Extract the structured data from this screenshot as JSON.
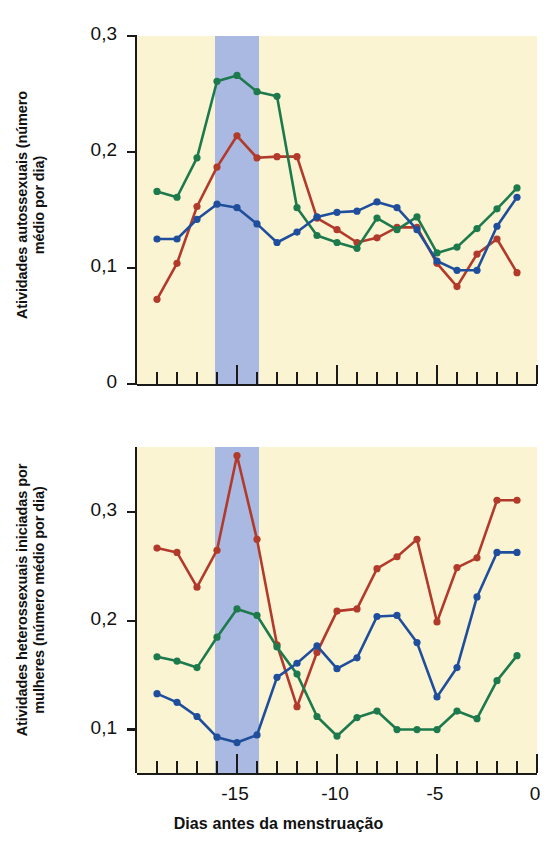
{
  "figure": {
    "background": "#ffffff",
    "plot_background": "#fbf4d3",
    "band_color": "#a9b9e2",
    "axis_color": "#1a1a1a"
  },
  "colors": {
    "red": "#b23a2b",
    "green": "#1d7a4c",
    "blue": "#1f4e9c"
  },
  "axis_titles": {
    "top_y": "Atividades autossexuais (número\nmédio por dia)",
    "bottom_y": "Atividades heterossexuais iniciadas por\nmulheres (número médio por dia)",
    "x": "Dias antes da menstruação"
  },
  "x_axis": {
    "labels": [
      "-15",
      "-10",
      "-5",
      "0"
    ],
    "label_values": [
      -15,
      -10,
      -5,
      0
    ],
    "min": -20,
    "max": 0,
    "major_ticks": [
      -15,
      -10,
      -5,
      0
    ],
    "minor_ticks": [
      -19,
      -18,
      -17,
      -16,
      -14,
      -13,
      -12,
      -11,
      -9,
      -8,
      -7,
      -6,
      -4,
      -3,
      -2,
      -1
    ]
  },
  "top_y_axis": {
    "labels": [
      "0",
      "0,1",
      "0,2",
      "0,3"
    ],
    "label_values": [
      0,
      0.1,
      0.2,
      0.3
    ],
    "min": 0,
    "max": 0.3
  },
  "bottom_y_axis": {
    "labels": [
      "0,1",
      "0,2",
      "0,3"
    ],
    "label_values": [
      0.1,
      0.2,
      0.3
    ],
    "min": 0.06,
    "max": 0.36
  },
  "highlight_band": {
    "start": -16.1,
    "end": -13.9,
    "label": "periovulatory-band"
  },
  "chart_data": [
    {
      "id": "chart-top",
      "type": "line",
      "title": "",
      "xlabel": "Dias antes da menstruação",
      "ylabel": "Atividades autossexuais (número médio por dia)",
      "xlim": [
        -20,
        0
      ],
      "ylim": [
        0,
        0.3
      ],
      "grid": false,
      "legend": "none",
      "x": [
        -19,
        -18,
        -17,
        -16,
        -15,
        -14,
        -13,
        -12,
        -11,
        -10,
        -9,
        -8,
        -7,
        -6,
        -5,
        -4,
        -3,
        -2,
        -1
      ],
      "series": [
        {
          "name": "red",
          "color": "#b23a2b",
          "values": [
            0.073,
            0.104,
            0.153,
            0.187,
            0.214,
            0.195,
            0.196,
            0.196,
            0.143,
            0.133,
            0.122,
            0.126,
            0.135,
            0.135,
            0.104,
            0.084,
            0.112,
            0.125,
            0.096
          ]
        },
        {
          "name": "green",
          "color": "#1d7a4c",
          "values": [
            0.166,
            0.161,
            0.195,
            0.261,
            0.266,
            0.252,
            0.248,
            0.152,
            0.128,
            0.122,
            0.117,
            0.143,
            0.133,
            0.144,
            0.113,
            0.118,
            0.134,
            0.151,
            0.169
          ]
        },
        {
          "name": "blue",
          "color": "#1f4e9c",
          "values": [
            0.125,
            0.125,
            0.142,
            0.155,
            0.152,
            0.138,
            0.122,
            0.131,
            0.144,
            0.148,
            0.149,
            0.157,
            0.152,
            0.133,
            0.106,
            0.098,
            0.098,
            0.136,
            0.161
          ]
        }
      ]
    },
    {
      "id": "chart-bottom",
      "type": "line",
      "title": "",
      "xlabel": "Dias antes da menstruação",
      "ylabel": "Atividades heterossexuais iniciadas por mulheres (número médio por dia)",
      "xlim": [
        -20,
        0
      ],
      "ylim": [
        0.06,
        0.36
      ],
      "grid": false,
      "legend": "none",
      "x": [
        -19,
        -18,
        -17,
        -16,
        -15,
        -14,
        -13,
        -12,
        -11,
        -10,
        -9,
        -8,
        -7,
        -6,
        -5,
        -4,
        -3,
        -2,
        -1
      ],
      "series": [
        {
          "name": "red",
          "color": "#b23a2b",
          "values": [
            0.267,
            0.263,
            0.231,
            0.265,
            0.352,
            0.275,
            0.178,
            0.121,
            0.171,
            0.209,
            0.211,
            0.248,
            0.259,
            0.275,
            0.199,
            0.249,
            0.258,
            0.311,
            0.311
          ]
        },
        {
          "name": "green",
          "color": "#1d7a4c",
          "values": [
            0.167,
            0.163,
            0.157,
            0.185,
            0.211,
            0.205,
            0.176,
            0.151,
            0.112,
            0.094,
            0.111,
            0.117,
            0.1,
            0.1,
            0.1,
            0.117,
            0.11,
            0.145,
            0.168
          ]
        },
        {
          "name": "blue",
          "color": "#1f4e9c",
          "values": [
            0.133,
            0.125,
            0.112,
            0.093,
            0.088,
            0.095,
            0.148,
            0.161,
            0.177,
            0.156,
            0.166,
            0.204,
            0.205,
            0.18,
            0.13,
            0.157,
            0.222,
            0.263,
            0.263
          ]
        }
      ]
    }
  ]
}
